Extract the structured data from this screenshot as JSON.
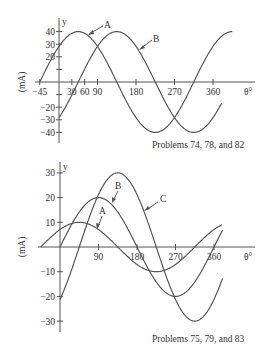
{
  "chart_data": [
    {
      "type": "line",
      "title": "",
      "caption": "Problems 74, 78, and 82",
      "xlabel": "θ°",
      "ylabel": "(mA)",
      "yaxis_name": "y",
      "x_ticks": [
        "-45",
        "30",
        "60",
        "90",
        "180",
        "270",
        "360"
      ],
      "y_ticks": [
        "40",
        "30",
        "20",
        "-20",
        "-30",
        "-40"
      ],
      "xlim": [
        -45,
        405
      ],
      "ylim": [
        -40,
        40
      ],
      "grid": false,
      "series": [
        {
          "name": "A",
          "formula": "40 sin(θ + 45°)",
          "amplitude": 40,
          "phase_deg": 45,
          "x": [
            -45,
            0,
            45,
            135,
            225,
            315,
            405
          ],
          "values": [
            0,
            28.3,
            40,
            0,
            -40,
            0,
            40
          ]
        },
        {
          "name": "B",
          "formula": "40 sin(θ - 45°)",
          "amplitude": 40,
          "phase_deg": -45,
          "x": [
            0,
            45,
            135,
            225,
            315,
            360
          ],
          "values": [
            -28.3,
            0,
            40,
            0,
            -40,
            -28.3
          ]
        }
      ]
    },
    {
      "type": "line",
      "title": "",
      "caption": "Problems 75, 79, and 83",
      "xlabel": "θ°",
      "ylabel": "(mA)",
      "yaxis_name": "y",
      "x_ticks": [
        "90",
        "180",
        "270",
        "360"
      ],
      "y_ticks": [
        "30",
        "20",
        "10",
        "-10",
        "-20",
        "-30"
      ],
      "xlim": [
        -45,
        405
      ],
      "ylim": [
        -30,
        30
      ],
      "grid": false,
      "series": [
        {
          "name": "A",
          "formula": "10 sin(θ + 45°)",
          "amplitude": 10,
          "phase_deg": 45,
          "x": [
            -45,
            45,
            135,
            225,
            315,
            380
          ],
          "values": [
            0,
            10,
            0,
            -10,
            0,
            9.4
          ]
        },
        {
          "name": "B",
          "formula": "20 sin θ",
          "amplitude": 20,
          "phase_deg": 0,
          "x": [
            0,
            90,
            180,
            270,
            360,
            380
          ],
          "values": [
            0,
            20,
            0,
            -20,
            0,
            6.8
          ]
        },
        {
          "name": "C",
          "formula": "30 sin(θ - 45°)",
          "amplitude": 30,
          "phase_deg": -45,
          "x": [
            0,
            45,
            135,
            225,
            315,
            360,
            380
          ],
          "values": [
            -21.2,
            0,
            30,
            0,
            -30,
            -21.2,
            -12
          ]
        }
      ]
    }
  ],
  "labels": {
    "top_caption": "Problems 74, 78, and 82",
    "bottom_caption": "Problems 75, 79, and 83",
    "xlabel": "θ°",
    "ylabel": "(mA)",
    "yname": "y",
    "curve_a": "A",
    "curve_b": "B",
    "curve_c": "C"
  }
}
